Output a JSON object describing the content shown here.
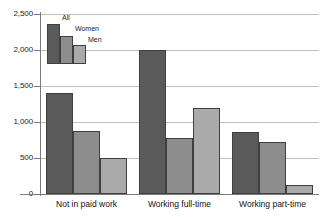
{
  "chart_data": {
    "type": "bar",
    "title": "",
    "subtitle": "",
    "xlabel": "",
    "ylabel": "",
    "ylim": [
      0,
      2500
    ],
    "ytick_labels": [
      "0",
      "500",
      "1,000",
      "1,500",
      "2,000",
      "2,500"
    ],
    "ytick_values": [
      0,
      500,
      1000,
      1500,
      2000,
      2500
    ],
    "grid": true,
    "legend_position": "top-left",
    "categories": [
      "Not in paid work",
      "Working full-time",
      "Working part-time"
    ],
    "series": [
      {
        "name": "All",
        "color": "#5a5a5a",
        "values": [
          1400,
          2000,
          860
        ]
      },
      {
        "name": "Women",
        "color": "#8d8d8d",
        "values": [
          875,
          780,
          725
        ]
      },
      {
        "name": "Men",
        "color": "#aaaaaa",
        "values": [
          500,
          1190,
          130
        ]
      }
    ],
    "legend": [
      {
        "label": "All",
        "color": "#5a5a5a"
      },
      {
        "label": "Women",
        "color": "#8d8d8d"
      },
      {
        "label": "Men",
        "color": "#aaaaaa"
      }
    ],
    "colors": {
      "axis": "#7a7a7a",
      "gridline": "#bfbfbf",
      "bar_outline": "#3f3f3f",
      "background": "#ffffff",
      "text": "#1c1c1c"
    }
  }
}
